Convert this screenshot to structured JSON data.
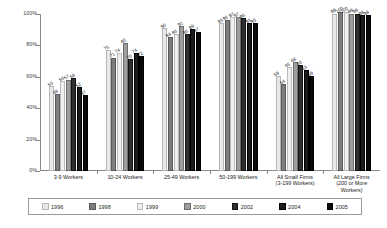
{
  "chart_data": {
    "type": "bar",
    "title": "",
    "xlabel": "",
    "ylabel": "",
    "ylim": [
      0,
      100
    ],
    "grid": false,
    "legend_position": "bottom",
    "categories": [
      "3-9 Workers",
      "10-24 Workers",
      "25-49 Workers",
      "50-199 Workers",
      "All Small Firms (3-199 Workers)",
      "All Large Firms (200 or More Workers)"
    ],
    "category_lines": [
      [
        "3-9 Workers"
      ],
      [
        "10-24 Workers"
      ],
      [
        "25-49 Workers"
      ],
      [
        "50-199 Workers"
      ],
      [
        "All Small Firms",
        "(3-199 Workers)"
      ],
      [
        "All Large Firms",
        "(200 or More",
        "Workers)"
      ]
    ],
    "ytick_labels": [
      "0%",
      "20%",
      "40%",
      "60%",
      "80%",
      "100%"
    ],
    "ytick_values": [
      0,
      20,
      40,
      60,
      80,
      100
    ],
    "series": [
      {
        "name": "1996",
        "color": "#e9e9e9",
        "values": [
          53,
          76,
          90,
          93,
          59,
          99
        ]
      },
      {
        "name": "1998",
        "color": "#7d7d7d",
        "values": [
          48,
          71,
          84,
          95,
          54,
          100
        ]
      },
      {
        "name": "1999",
        "color": "#efefef",
        "values": [
          56,
          74,
          86,
          97,
          65,
          100
        ]
      },
      {
        "name": "2000",
        "color": "#9e9e9e",
        "values": [
          57,
          80,
          91,
          97,
          68,
          99
        ]
      },
      {
        "name": "2002",
        "color": "#2f2f2f",
        "values": [
          58,
          70,
          86,
          96,
          66,
          99
        ]
      },
      {
        "name": "2004",
        "color": "#1b1b1b",
        "values": [
          52,
          74,
          89,
          93,
          63,
          98
        ]
      },
      {
        "name": "2005",
        "color": "#0a0a0a",
        "values": [
          47,
          72,
          87,
          93,
          59,
          98
        ]
      }
    ]
  },
  "legend": {
    "items": [
      {
        "label": "1996"
      },
      {
        "label": "1998"
      },
      {
        "label": "1999"
      },
      {
        "label": "2000"
      },
      {
        "label": "2002"
      },
      {
        "label": "2004"
      },
      {
        "label": "2005"
      }
    ]
  }
}
